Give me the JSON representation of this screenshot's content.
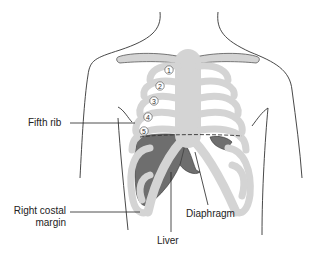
{
  "figure": {
    "colors": {
      "bone": "#d4d4d4",
      "liver": "#6e6e6e",
      "outline": "#333333",
      "background": "#ffffff"
    }
  },
  "labels": {
    "fifth_rib": "Fifth rib",
    "right_costal_margin_line1": "Right costal",
    "right_costal_margin_line2": "margin",
    "liver": "Liver",
    "diaphragm": "Diaphragm"
  },
  "rib_numbers": [
    "1",
    "2",
    "3",
    "4",
    "5"
  ]
}
